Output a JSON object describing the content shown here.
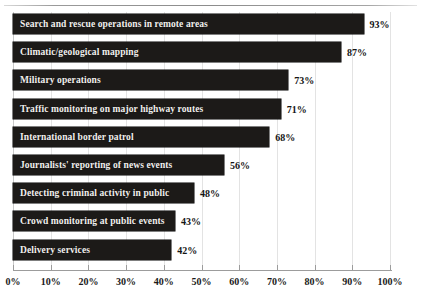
{
  "chart_data": {
    "type": "bar",
    "orientation": "horizontal",
    "title": "",
    "subtitle": "",
    "xlabel": "",
    "ylabel": "",
    "xlim": [
      0,
      100
    ],
    "xticks": [
      0,
      10,
      20,
      30,
      40,
      50,
      60,
      70,
      80,
      90,
      100
    ],
    "xtick_labels": [
      "0%",
      "10%",
      "20%",
      "30%",
      "40%",
      "50%",
      "60%",
      "70%",
      "80%",
      "90%",
      "100%"
    ],
    "grid": true,
    "grid_axis": "x",
    "legend": false,
    "legend_position": "none",
    "bar_color": "#1c1a18",
    "label_color": "#f2f0ee",
    "value_color": "#141414",
    "categories": [
      "Search and rescue operations in remote areas",
      "Climatic/geological mapping",
      "Military operations",
      "Traffic monitoring on major highway routes",
      "International border patrol",
      "Journalists' reporting of news events",
      "Detecting criminal activity in public",
      "Crowd monitoring at public events",
      "Delivery services"
    ],
    "values": [
      93,
      87,
      73,
      71,
      68,
      56,
      48,
      43,
      42
    ],
    "value_labels": [
      "93%",
      "87%",
      "73%",
      "71%",
      "68%",
      "56%",
      "48%",
      "43%",
      "42%"
    ]
  }
}
